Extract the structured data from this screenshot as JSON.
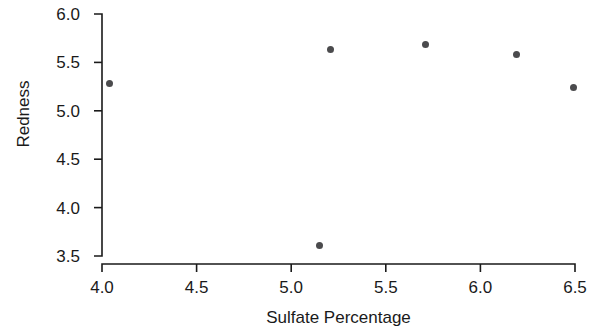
{
  "chart_data": {
    "type": "scatter",
    "title": "",
    "xlabel": "Sulfate Percentage",
    "ylabel": "Redness",
    "xlim": [
      4.0,
      6.5
    ],
    "ylim": [
      3.5,
      6.0
    ],
    "xticks": [
      "4.0",
      "4.5",
      "5.0",
      "5.5",
      "6.0",
      "6.5"
    ],
    "xtick_values": [
      4.0,
      4.5,
      5.0,
      5.5,
      6.0,
      6.5
    ],
    "yticks": [
      "6.0",
      "5.5",
      "5.0",
      "4.5",
      "4.0",
      "3.5"
    ],
    "ytick_values": [
      6.0,
      5.5,
      5.0,
      4.5,
      4.0,
      3.5
    ],
    "grid": false,
    "legend": null,
    "marker_color": "#4b4b4d",
    "axis_color": "#1a1a1a",
    "background": "#ffffff",
    "points": [
      {
        "x": 4.04,
        "y": 5.28
      },
      {
        "x": 5.15,
        "y": 3.61
      },
      {
        "x": 5.21,
        "y": 5.63
      },
      {
        "x": 5.71,
        "y": 5.68
      },
      {
        "x": 6.19,
        "y": 5.58
      },
      {
        "x": 6.49,
        "y": 5.24
      }
    ]
  }
}
